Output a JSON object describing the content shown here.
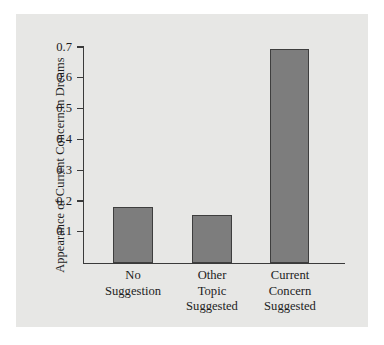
{
  "chart_data": {
    "type": "bar",
    "title": "",
    "xlabel": "",
    "ylabel": "Appearance of Current Concern in Dreams",
    "categories": [
      "No Suggestion",
      "Other Topic Suggested",
      "Current Concern Suggested"
    ],
    "category_lines": [
      [
        "No",
        "Suggestion"
      ],
      [
        "Other",
        "Topic",
        "Suggested"
      ],
      [
        "Current",
        "Concern",
        "Suggested"
      ]
    ],
    "values": [
      0.18,
      0.155,
      0.695
    ],
    "ylim": [
      0,
      0.74
    ],
    "yticks": [
      0.1,
      0.2,
      0.3,
      0.4,
      0.5,
      0.6,
      0.7
    ],
    "ytick_labels": [
      "0.1",
      "0.2",
      "0.3",
      "0.4",
      "0.5",
      "0.6",
      "0.7"
    ],
    "grid": false,
    "legend": false,
    "legend_position": "none",
    "bar_color": "#7d7d7d",
    "bar_edge_color": "#3e3e3e",
    "axis_color": "#3a3a3a",
    "panel_color": "#e7e7e5",
    "page_color": "#ffffff",
    "text_color": "#1d1d1d"
  }
}
